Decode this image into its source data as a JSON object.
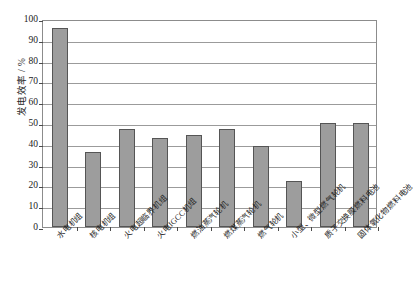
{
  "chart_data": {
    "type": "bar",
    "title": "",
    "xlabel": "",
    "ylabel": "发电效率 / %",
    "ylim": [
      0,
      100
    ],
    "ytick_step": 10,
    "yticks": [
      "100",
      "90",
      "80",
      "70",
      "60",
      "50",
      "40",
      "30",
      "20",
      "10",
      "0"
    ],
    "grid": true,
    "legend": "none",
    "bar_color": "#9d9d9d",
    "bar_edge_color": "#555555",
    "axis_color": "#8c8c8c",
    "categories": [
      "水电机组",
      "核电机组",
      "火电超临界机组",
      "火电IGCC机组",
      "燃油蒸汽轮机",
      "燃煤蒸汽轮机",
      "燃气轮机",
      "小型、微型燃气轮机",
      "质子交换膜燃料电池",
      "固体氧化物燃料电池"
    ],
    "values": [
      95.5,
      36,
      47,
      43,
      44,
      47,
      39,
      22,
      50,
      50
    ]
  }
}
